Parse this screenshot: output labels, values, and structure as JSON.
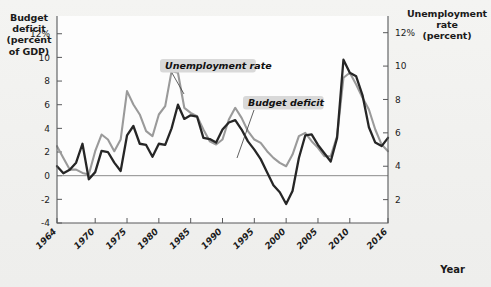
{
  "labels": {
    "left_axis_title": "Budget\ndeficit\n(percent\nof GDP)",
    "right_axis_title": "Unemployment\nrate\n(percent)",
    "x_axis_title": "Year",
    "callout_unemployment": "Unemployment rate",
    "callout_deficit": "Budget deficit"
  },
  "colors": {
    "unemployment_line": "#9a9a9a",
    "deficit_line": "#262626",
    "callout_background": "#d9d9d9",
    "axis": "#58595b",
    "zero_line": "#8c8c8c",
    "page_background": "#f2f2f0",
    "plot_background": "#fdfdfd"
  },
  "chart_data": {
    "type": "line",
    "title": "",
    "xlabel": "Year",
    "grid": false,
    "legend_position": "inline-callouts",
    "x": [
      1964,
      1965,
      1966,
      1967,
      1968,
      1969,
      1970,
      1971,
      1972,
      1973,
      1974,
      1975,
      1976,
      1977,
      1978,
      1979,
      1980,
      1981,
      1982,
      1983,
      1984,
      1985,
      1986,
      1987,
      1988,
      1989,
      1990,
      1991,
      1992,
      1993,
      1994,
      1995,
      1996,
      1997,
      1998,
      1999,
      2000,
      2001,
      2002,
      2003,
      2004,
      2005,
      2006,
      2007,
      2008,
      2009,
      2010,
      2011,
      2012,
      2013,
      2014,
      2015,
      2016
    ],
    "x_tick_labels": [
      "1964",
      "1970",
      "1975",
      "1980",
      "1985",
      "1990",
      "1995",
      "2000",
      "2005",
      "2010",
      "2016"
    ],
    "x_tick_values": [
      1964,
      1970,
      1975,
      1980,
      1985,
      1990,
      1995,
      2000,
      2005,
      2010,
      2016
    ],
    "xlim": [
      1964,
      2016
    ],
    "axes": [
      {
        "id": "left",
        "label": "Budget deficit (percent of GDP)",
        "tick_labels": [
          "12%",
          "10",
          "8",
          "6",
          "4",
          "2",
          "0",
          "-2",
          "-4"
        ],
        "tick_values": [
          12,
          10,
          8,
          6,
          4,
          2,
          0,
          -2,
          -4
        ],
        "ylim": [
          -4,
          13.5
        ]
      },
      {
        "id": "right",
        "label": "Unemployment rate (percent)",
        "tick_labels": [
          "12%",
          "10",
          "8",
          "6",
          "4",
          "2"
        ],
        "tick_values": [
          12,
          10,
          8,
          6,
          4,
          2
        ],
        "ylim": [
          0.6,
          13.0
        ]
      }
    ],
    "series": [
      {
        "name": "Budget deficit",
        "axis": "left",
        "unit": "percent of GDP",
        "color": "#262626",
        "values": [
          0.8,
          0.2,
          0.5,
          1.1,
          2.7,
          -0.3,
          0.3,
          2.1,
          2.0,
          1.1,
          0.4,
          3.4,
          4.2,
          2.7,
          2.6,
          1.6,
          2.7,
          2.6,
          4.0,
          6.0,
          4.8,
          5.1,
          5.0,
          3.2,
          3.1,
          2.8,
          3.9,
          4.5,
          4.7,
          3.9,
          2.9,
          2.2,
          1.4,
          0.3,
          -0.8,
          -1.4,
          -2.4,
          -1.3,
          1.5,
          3.4,
          3.5,
          2.6,
          1.9,
          1.2,
          3.2,
          9.8,
          8.7,
          8.4,
          6.8,
          4.1,
          2.8,
          2.5,
          3.2
        ]
      },
      {
        "name": "Unemployment rate",
        "axis": "right",
        "unit": "percent",
        "color": "#9a9a9a",
        "values": [
          5.2,
          4.5,
          3.8,
          3.8,
          3.6,
          3.5,
          4.9,
          5.9,
          5.6,
          4.9,
          5.6,
          8.5,
          7.7,
          7.1,
          6.1,
          5.8,
          7.1,
          7.6,
          9.7,
          9.6,
          7.5,
          7.2,
          7.0,
          6.2,
          5.5,
          5.3,
          5.6,
          6.8,
          7.5,
          6.9,
          6.1,
          5.6,
          5.4,
          4.9,
          4.5,
          4.2,
          4.0,
          4.7,
          5.8,
          6.0,
          5.5,
          5.1,
          4.6,
          4.6,
          5.8,
          9.3,
          9.6,
          8.9,
          8.1,
          7.4,
          6.2,
          5.3,
          4.9
        ]
      }
    ],
    "annotations": [
      {
        "text": "Unemployment rate",
        "points_to_series": "Unemployment rate",
        "approx_x": 1980
      },
      {
        "text": "Budget deficit",
        "points_to_series": "Budget deficit",
        "approx_x": 1996
      }
    ]
  }
}
